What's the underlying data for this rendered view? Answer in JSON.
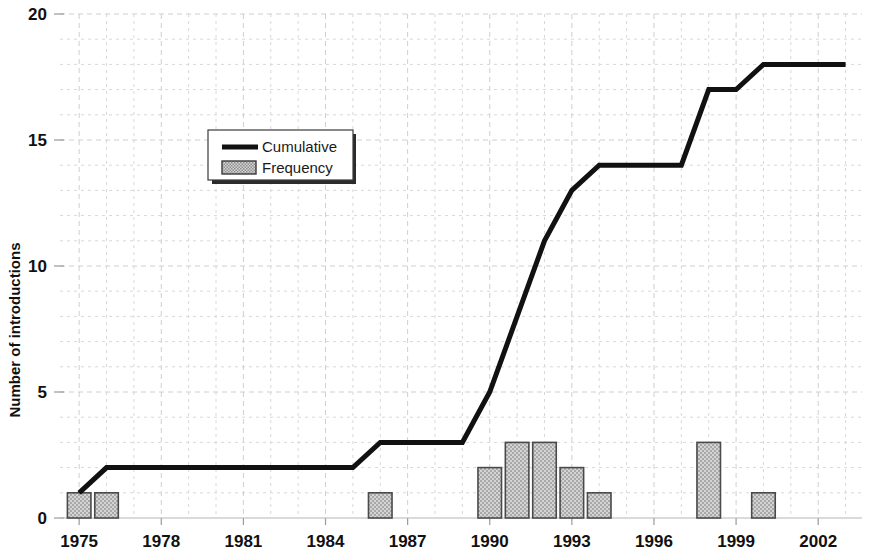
{
  "chart_data": {
    "type": "bar",
    "title": "",
    "xlabel": "",
    "ylabel": "Number of introductions",
    "xlim": [
      1974.3,
      2003.6
    ],
    "ylim": [
      0,
      20
    ],
    "yticks": [
      0,
      5,
      10,
      15,
      20
    ],
    "xticks": [
      1975,
      1978,
      1981,
      1984,
      1987,
      1990,
      1993,
      1996,
      1999,
      2002
    ],
    "grid": true,
    "legend_position": "upper left",
    "categories": [
      1975,
      1976,
      1977,
      1978,
      1979,
      1980,
      1981,
      1982,
      1983,
      1984,
      1985,
      1986,
      1987,
      1988,
      1989,
      1990,
      1991,
      1992,
      1993,
      1994,
      1995,
      1996,
      1997,
      1998,
      1999,
      2000,
      2001,
      2002,
      2003
    ],
    "series": [
      {
        "name": "Frequency",
        "type": "bar",
        "values": [
          1,
          1,
          0,
          0,
          0,
          0,
          0,
          0,
          0,
          0,
          0,
          1,
          0,
          0,
          0,
          2,
          3,
          3,
          2,
          1,
          0,
          0,
          0,
          3,
          0,
          1,
          0,
          0,
          0
        ]
      },
      {
        "name": "Cumulative",
        "type": "line",
        "values": [
          1,
          2,
          2,
          2,
          2,
          2,
          2,
          2,
          2,
          2,
          2,
          3,
          3,
          3,
          3,
          5,
          8,
          11,
          13,
          14,
          14,
          14,
          14,
          17,
          17,
          18,
          18,
          18,
          18
        ]
      }
    ]
  },
  "legend": {
    "items": [
      {
        "label": "Cumulative",
        "marker": "line",
        "color": "#111111"
      },
      {
        "label": "Frequency",
        "marker": "hatched-swatch",
        "color": "#bdbdbd"
      }
    ]
  },
  "axes": {
    "y_title": "Number of introductions",
    "y_tick_labels": [
      "0",
      "5",
      "10",
      "15",
      "20"
    ],
    "x_tick_labels": [
      "1975",
      "1978",
      "1981",
      "1984",
      "1987",
      "1990",
      "1993",
      "1996",
      "1999",
      "2002"
    ]
  },
  "colors": {
    "line": "#111111",
    "bar_fill": "#c8c8c8",
    "bar_edge": "#4a4a4a",
    "grid": "#d8d8d8",
    "background": "#ffffff",
    "text": "#111111"
  }
}
